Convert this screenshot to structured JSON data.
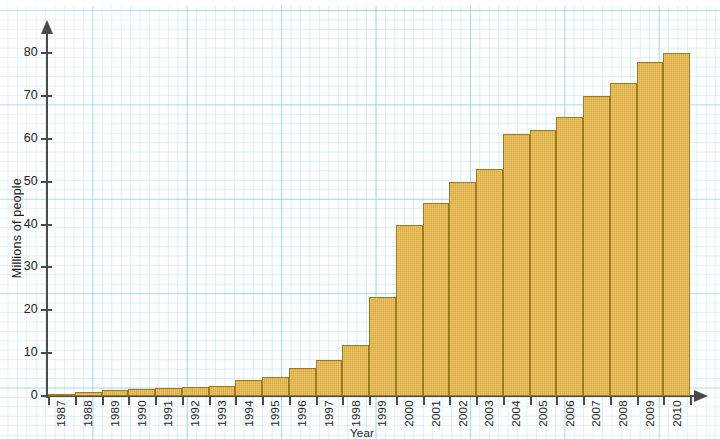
{
  "chart_data": {
    "type": "bar",
    "title": "",
    "subtitle": "",
    "xlabel": "Year",
    "ylabel": "Millions of people",
    "categories": [
      "1987",
      "1988",
      "1989",
      "1990",
      "1991",
      "1992",
      "1993",
      "1994",
      "1995",
      "1996",
      "1997",
      "1998",
      "1999",
      "2000",
      "2001",
      "2002",
      "2003",
      "2004",
      "2005",
      "2006",
      "2007",
      "2008",
      "2009",
      "2010"
    ],
    "values": [
      0.3,
      1.0,
      1.5,
      1.7,
      1.8,
      2.0,
      2.3,
      3.8,
      4.5,
      6.5,
      8.5,
      12.0,
      23.0,
      40.0,
      45.0,
      50.0,
      53.0,
      61.0,
      62.0,
      65.0,
      70.0,
      73.0,
      78.0,
      80.0
    ],
    "ylim": [
      0,
      80
    ],
    "yticks": [
      0,
      10,
      20,
      30,
      40,
      50,
      60,
      70,
      80
    ],
    "ytick_labels": [
      "0",
      "10",
      "20",
      "30",
      "40",
      "50",
      "60",
      "70",
      "80"
    ],
    "grid": true,
    "legend": null,
    "bar_color": "#eab94a",
    "bar_edge_color": "#9b7a1e",
    "grid_color": "#78bed7",
    "axis_color": "#4a4a48",
    "background": "#fdfeff"
  },
  "axis": {
    "y_title": "Millions of people",
    "x_title": "Year"
  }
}
